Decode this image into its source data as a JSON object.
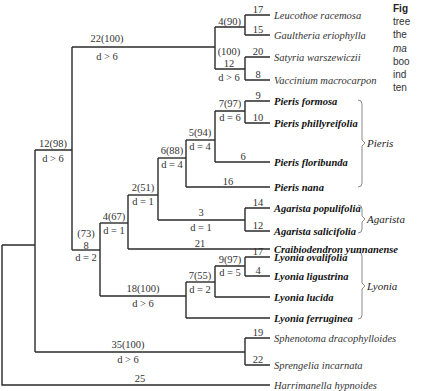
{
  "caption": {
    "lines": [
      "Fig",
      "tree",
      "the",
      "ma",
      "boo",
      "ind",
      "ten"
    ]
  },
  "nodes": {
    "n_top4": {
      "support": "4(90)"
    },
    "n_top100": {
      "support": "(100)",
      "length": "12",
      "d": "d > 6"
    },
    "n_22": {
      "support": "22(100)",
      "d": "d > 6"
    },
    "n_12": {
      "support": "12(98)",
      "d": "d > 6"
    },
    "n_73": {
      "support": "(73)",
      "length": "8",
      "d": "d = 2"
    },
    "n_4_67": {
      "support": "4(67)",
      "d": "d = 1"
    },
    "n_2_51": {
      "support": "2(51)",
      "d": "d = 1"
    },
    "n_6_88": {
      "support": "6(88)",
      "d": "d = 4"
    },
    "n_5_94": {
      "support": "5(94)",
      "d": "d = 4"
    },
    "n_7_97": {
      "support": "7(97)",
      "d": "d = 6"
    },
    "n_agar": {
      "length": "3",
      "d": "d = 1"
    },
    "n_18": {
      "support": "18(100)",
      "d": "d > 6"
    },
    "n_7_55": {
      "support": "7(55)",
      "d": "d = 2"
    },
    "n_9_97": {
      "support": "9(97)",
      "d": "d = 5"
    },
    "n_35": {
      "support": "35(100)",
      "d": "d > 6"
    },
    "n_root": {
      "length": "25"
    }
  },
  "taxa": [
    {
      "name": "Leucothoe racemosa",
      "branch": "17",
      "bold": false
    },
    {
      "name": "Gaultheria eriophylla",
      "branch": "15",
      "bold": false
    },
    {
      "name": "Satyria warszewiczii",
      "branch": "20",
      "bold": false
    },
    {
      "name": "Vaccinium macrocarpon",
      "branch": "8",
      "bold": false
    },
    {
      "name": "Pieris formosa",
      "branch": "9",
      "bold": true
    },
    {
      "name": "Pieris phillyreifolia",
      "branch": "10",
      "bold": true
    },
    {
      "name": "Pieris floribunda",
      "branch": "6",
      "bold": true
    },
    {
      "name": "Pieris nana",
      "branch": "16",
      "bold": true
    },
    {
      "name": "Agarista populifolia",
      "branch": "14",
      "bold": true
    },
    {
      "name": "Agarista salicifolia",
      "branch": "12",
      "bold": true
    },
    {
      "name": "Craibiodendron yunnanense",
      "branch": "21",
      "bold": true
    },
    {
      "name": "Lyonia ovalifolia",
      "branch": "17",
      "bold": true
    },
    {
      "name": "Lyonia ligustrina",
      "branch": "4",
      "bold": true
    },
    {
      "name": "Lyonia lucida",
      "branch": "",
      "bold": true
    },
    {
      "name": "Lyonia ferruginea",
      "branch": "",
      "bold": true
    },
    {
      "name": "Sphenotoma dracophylloides",
      "branch": "19",
      "bold": false
    },
    {
      "name": "Sprengelia incarnata",
      "branch": "22",
      "bold": false
    },
    {
      "name": "Harrimanella hypnoides",
      "branch": "",
      "bold": false
    }
  ],
  "genera": [
    {
      "name": "Pieris"
    },
    {
      "name": "Agarista"
    },
    {
      "name": "Lyonia"
    }
  ],
  "colors": {
    "line": "#2a2a2a",
    "bracket": "#888888"
  }
}
